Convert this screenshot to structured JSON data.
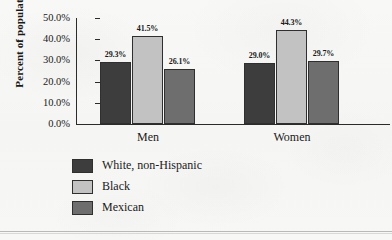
{
  "chart_data": {
    "type": "bar",
    "title": "",
    "xlabel": "",
    "ylabel": "Percent of population",
    "categories": [
      "Men",
      "Women"
    ],
    "series": [
      {
        "name": "White, non-Hispanic",
        "values": [
          29.3,
          29.0
        ],
        "color": "#3d3d3d",
        "labels": [
          "29.3%",
          "29.0%"
        ]
      },
      {
        "name": "Black",
        "values": [
          41.5,
          44.3
        ],
        "color": "#c2c2c2",
        "labels": [
          "41.5%",
          "44.3%"
        ]
      },
      {
        "name": "Mexican",
        "values": [
          26.1,
          29.7
        ],
        "color": "#6e6e6e",
        "labels": [
          "26.1%",
          "29.7%"
        ]
      }
    ],
    "ylim": [
      0,
      50
    ],
    "ytick_labels": [
      "50.0%",
      "40.0%",
      "30.0%",
      "20.0%",
      "10.0%",
      "0.0%"
    ],
    "ytick_values": [
      50,
      40,
      30,
      20,
      10,
      0
    ],
    "grid": false,
    "legend_position": "below-left"
  },
  "axis": {
    "y_title": "Percent of population"
  },
  "legend": {
    "items": [
      {
        "label": "White, non-Hispanic",
        "color": "#3d3d3d"
      },
      {
        "label": "Black",
        "color": "#c2c2c2"
      },
      {
        "label": "Mexican",
        "color": "#6e6e6e"
      }
    ]
  }
}
